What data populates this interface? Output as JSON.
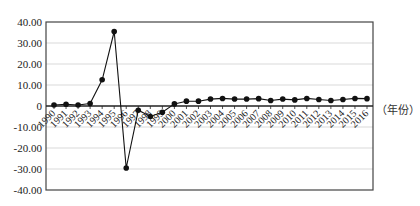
{
  "chart_data": {
    "type": "line",
    "title": "",
    "xlabel": "（年份）",
    "ylabel": "",
    "ylim": [
      -40,
      40
    ],
    "yticks": [
      "40.00",
      "30.00",
      "20.00",
      "10.00",
      "0",
      "-10.00",
      "-20.00",
      "-30.00",
      "-40.00"
    ],
    "grid": true,
    "legend": null,
    "categories": [
      "1990",
      "1991",
      "1992",
      "1993",
      "1994",
      "1995",
      "1996",
      "1997",
      "1998",
      "1999",
      "2000",
      "2001",
      "2002",
      "2003",
      "2004",
      "2005",
      "2006",
      "2007",
      "2008",
      "2009",
      "2010",
      "2011",
      "2012",
      "2013",
      "2014",
      "2015",
      "2016"
    ],
    "series": [
      {
        "name": "series-1",
        "marker": "circle",
        "color": "#111111",
        "values": [
          0.5,
          0.8,
          0.5,
          1.2,
          12.5,
          35.5,
          -29.5,
          -2.0,
          -5.0,
          -3.0,
          1.0,
          2.3,
          2.3,
          3.3,
          3.6,
          3.3,
          3.3,
          3.5,
          2.6,
          3.3,
          2.9,
          3.6,
          3.1,
          2.6,
          3.1,
          3.6,
          3.5
        ]
      }
    ]
  },
  "axis_unit_label": "（年份）"
}
